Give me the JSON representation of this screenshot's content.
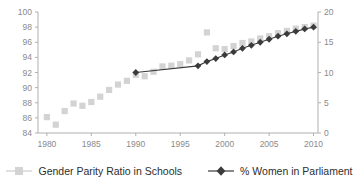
{
  "chart_data": {
    "type": "line",
    "title": "",
    "xlabel": "",
    "ylabel": "",
    "xlim": [
      1979,
      2010.5
    ],
    "xticks": [
      1980,
      1985,
      1990,
      1995,
      2000,
      2005,
      2010
    ],
    "grid": false,
    "legend_position": "bottom",
    "axes": [
      {
        "id": "left",
        "label": "",
        "ylim": [
          84,
          100
        ],
        "yticks": [
          84,
          86,
          88,
          90,
          92,
          94,
          96,
          98,
          100
        ]
      },
      {
        "id": "right",
        "label": "",
        "ylim": [
          0,
          20
        ],
        "yticks": [
          0,
          5,
          10,
          15,
          20
        ]
      }
    ],
    "series": [
      {
        "name": "Gender Parity Ratio in Schools",
        "axis": "left",
        "marker": "square",
        "color": "#d3d3d3",
        "line": false,
        "x": [
          1980,
          1981,
          1982,
          1983,
          1984,
          1985,
          1986,
          1987,
          1988,
          1989,
          1990,
          1991,
          1992,
          1993,
          1994,
          1995,
          1996,
          1997,
          1998,
          1999,
          2000,
          2001,
          2002,
          2003,
          2004,
          2005,
          2006,
          2007,
          2008,
          2009,
          2010
        ],
        "values": [
          86.1,
          85.1,
          86.9,
          87.9,
          87.6,
          88.1,
          88.8,
          89.7,
          90.4,
          90.9,
          91.7,
          91.5,
          92.1,
          92.8,
          92.9,
          93.1,
          93.6,
          94.4,
          97.3,
          95.2,
          95.1,
          95.5,
          95.9,
          96.1,
          96.5,
          96.8,
          97.2,
          97.5,
          97.8,
          98.0,
          98.2
        ]
      },
      {
        "name": "% Women in Parliament",
        "axis": "right",
        "marker": "diamond",
        "color": "#3b3b3b",
        "line": true,
        "x": [
          1990,
          1997,
          1998,
          1999,
          2000,
          2001,
          2002,
          2003,
          2004,
          2005,
          2006,
          2007,
          2008,
          2009,
          2010
        ],
        "values": [
          10.0,
          11.1,
          11.8,
          12.3,
          12.9,
          13.4,
          14.0,
          14.5,
          15.0,
          15.5,
          16.0,
          16.4,
          16.8,
          17.2,
          17.5
        ]
      }
    ]
  },
  "legend": {
    "items": [
      {
        "label": "Gender Parity Ratio in Schools",
        "marker": "square-marker-icon"
      },
      {
        "label": "% Women in Parliament",
        "marker": "diamond-line-marker-icon"
      }
    ]
  },
  "colors": {
    "series_light": "#d3d3d3",
    "series_dark": "#3b3b3b",
    "axis": "#b0b0b0",
    "tick_text": "#8a8a8a",
    "legend_text": "#2e2e2e",
    "background": "#ffffff"
  }
}
